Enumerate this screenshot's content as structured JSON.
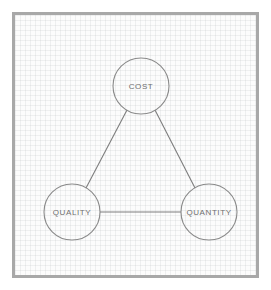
{
  "diagram": {
    "style": {
      "frame_border_color": "#a8a8a8",
      "page_background": "#ffffff",
      "paper_background": "#fcfcfc",
      "grid_line_color": "#aaafb4",
      "node_stroke_color": "#8a8a8a",
      "edge_stroke_color": "#7d7d7d",
      "label_text_color": "#6e6e6e"
    },
    "nodes": [
      {
        "id": "cost",
        "label": "COST",
        "cx": 126,
        "cy": 71,
        "r": 28
      },
      {
        "id": "quality",
        "label": "QUALITY",
        "cx": 57,
        "cy": 197,
        "r": 28
      },
      {
        "id": "quantity",
        "label": "QUANTITY",
        "cx": 194,
        "cy": 197,
        "r": 28
      }
    ],
    "edges": [
      {
        "id": "cost-quality",
        "from": "cost",
        "to": "quality",
        "x1": 112,
        "y1": 95,
        "x2": 71,
        "y2": 173
      },
      {
        "id": "cost-quantity",
        "from": "cost",
        "to": "quantity",
        "x1": 140,
        "y1": 95,
        "x2": 180,
        "y2": 173
      },
      {
        "id": "quality-quantity",
        "from": "quality",
        "to": "quantity",
        "x1": 85,
        "y1": 197,
        "x2": 166,
        "y2": 197
      }
    ]
  }
}
